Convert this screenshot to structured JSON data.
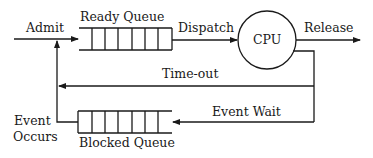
{
  "diagram": {
    "labels": {
      "admit": "Admit",
      "ready_queue": "Ready Queue",
      "dispatch": "Dispatch",
      "cpu": "CPU",
      "release": "Release",
      "timeout": "Time-out",
      "event_wait": "Event Wait",
      "event_occurs_1": "Event",
      "event_occurs_2": "Occurs",
      "blocked_queue": "Blocked Queue"
    },
    "colors": {
      "stroke": "#1a1a1a",
      "background": "#ffffff"
    }
  }
}
